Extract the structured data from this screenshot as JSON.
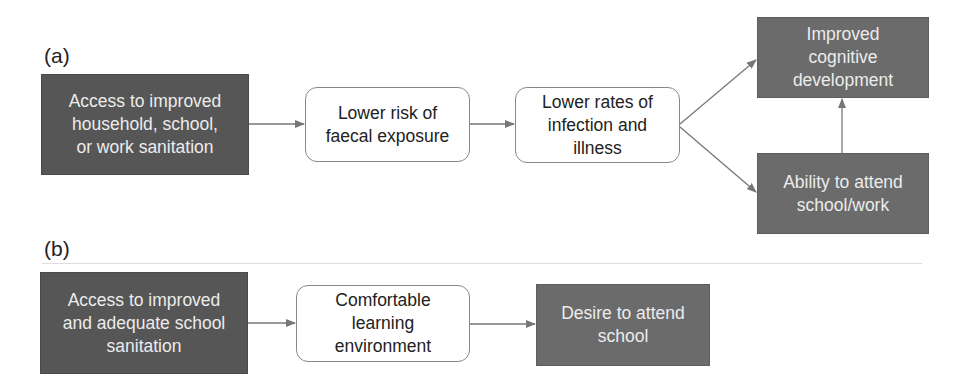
{
  "panel_a": {
    "label": "(a)",
    "nodes": [
      {
        "id": "a1",
        "text": "Access to improved\nhousehold, school,\nor work sanitation",
        "style": "dark"
      },
      {
        "id": "a2",
        "text": "Lower risk of\nfaecal exposure",
        "style": "white"
      },
      {
        "id": "a3",
        "text": "Lower rates of\ninfection and\nillness",
        "style": "white"
      },
      {
        "id": "a4",
        "text": "Improved\ncognitive\ndevelopment",
        "style": "mid"
      },
      {
        "id": "a5",
        "text": "Ability to attend\nschool/work",
        "style": "mid"
      }
    ],
    "edges": [
      [
        "a1",
        "a2"
      ],
      [
        "a2",
        "a3"
      ],
      [
        "a3",
        "a4"
      ],
      [
        "a3",
        "a5"
      ],
      [
        "a5",
        "a4"
      ]
    ]
  },
  "panel_b": {
    "label": "(b)",
    "nodes": [
      {
        "id": "b1",
        "text": "Access to improved\nand adequate school\nsanitation",
        "style": "dark"
      },
      {
        "id": "b2",
        "text": "Comfortable\nlearning\nenvironment",
        "style": "white"
      },
      {
        "id": "b3",
        "text": "Desire to attend\nschool",
        "style": "mid"
      }
    ],
    "edges": [
      [
        "b1",
        "b2"
      ],
      [
        "b2",
        "b3"
      ]
    ]
  },
  "colors": {
    "dark_box": "#565656",
    "mid_box": "#6b6b6b",
    "arrow": "#777777",
    "white_border": "#888888"
  }
}
